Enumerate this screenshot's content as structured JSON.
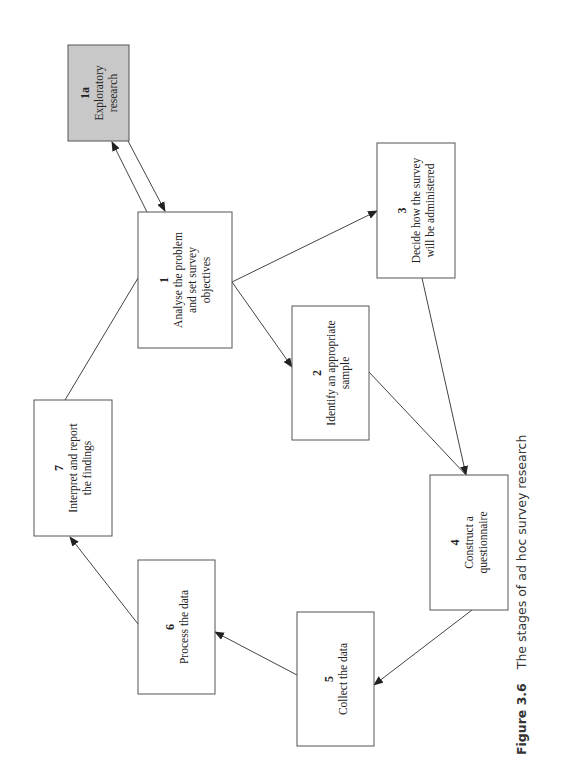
{
  "figure": {
    "label": "Figure 3.6",
    "caption": "The stages of ad hoc survey research"
  },
  "colors": {
    "box_fill": "#ffffff",
    "highlight_fill": "#c8c8c8",
    "stroke": "#555555"
  },
  "nodes": [
    {
      "id": "1a",
      "number": "1a",
      "lines": [
        "Exploratory",
        "research"
      ],
      "highlight": true,
      "x": 68,
      "y": 45,
      "w": 61,
      "h": 96
    },
    {
      "id": "1",
      "number": "1",
      "lines": [
        "Analyse the problem",
        "and set survey",
        "objectives"
      ],
      "highlight": false,
      "x": 138,
      "y": 212,
      "w": 94,
      "h": 136
    },
    {
      "id": "2",
      "number": "2",
      "lines": [
        "Identify an appropriate",
        "sample"
      ],
      "highlight": false,
      "x": 292,
      "y": 306,
      "w": 77,
      "h": 134
    },
    {
      "id": "3",
      "number": "3",
      "lines": [
        "Decide how the survey",
        "will be administered"
      ],
      "highlight": false,
      "x": 377,
      "y": 143,
      "w": 78,
      "h": 135
    },
    {
      "id": "4",
      "number": "4",
      "lines": [
        "Construct a",
        "questionnaire"
      ],
      "highlight": false,
      "x": 430,
      "y": 475,
      "w": 78,
      "h": 135
    },
    {
      "id": "5",
      "number": "5",
      "lines": [
        "Collect the data"
      ],
      "highlight": false,
      "x": 297,
      "y": 612,
      "w": 77,
      "h": 134
    },
    {
      "id": "6",
      "number": "6",
      "lines": [
        "Process the data"
      ],
      "highlight": false,
      "x": 138,
      "y": 560,
      "w": 77,
      "h": 134
    },
    {
      "id": "7",
      "number": "7",
      "lines": [
        "Interpret and report",
        "the findings"
      ],
      "highlight": false,
      "x": 34,
      "y": 400,
      "w": 78,
      "h": 136
    }
  ],
  "edges": [
    {
      "from": "1",
      "to": "1a",
      "x1": 147,
      "y1": 212,
      "x2": 112,
      "y2": 142,
      "arrow": true
    },
    {
      "from": "1a",
      "to": "1",
      "x1": 128,
      "y1": 141,
      "x2": 165,
      "y2": 211,
      "arrow": true
    },
    {
      "from": "1",
      "to": "3",
      "x1": 232,
      "y1": 282,
      "x2": 377,
      "y2": 211,
      "arrow": true
    },
    {
      "from": "1",
      "to": "2",
      "x1": 232,
      "y1": 282,
      "x2": 292,
      "y2": 367,
      "arrow": true
    },
    {
      "from": "3",
      "to": "4",
      "x1": 422,
      "y1": 278,
      "x2": 466,
      "y2": 475,
      "arrow": true
    },
    {
      "from": "2",
      "to": "4",
      "x1": 369,
      "y1": 372,
      "x2": 466,
      "y2": 475,
      "arrow": false
    },
    {
      "from": "4",
      "to": "5",
      "x1": 472,
      "y1": 610,
      "x2": 374,
      "y2": 685,
      "arrow": true
    },
    {
      "from": "5",
      "to": "6",
      "x1": 297,
      "y1": 675,
      "x2": 215,
      "y2": 632,
      "arrow": true
    },
    {
      "from": "6",
      "to": "7",
      "x1": 138,
      "y1": 624,
      "x2": 70,
      "y2": 537,
      "arrow": true
    },
    {
      "from": "7",
      "to": "1",
      "x1": 65,
      "y1": 400,
      "x2": 138,
      "y2": 278,
      "arrow": false
    }
  ]
}
